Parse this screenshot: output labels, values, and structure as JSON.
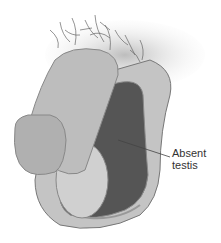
{
  "figure": {
    "callouts": [
      {
        "line1": "Absent",
        "line2": "testis"
      }
    ]
  },
  "colors": {
    "skin_light": "#c9c9c9",
    "skin_mid": "#b3b3b3",
    "cavity_dark": "#555555",
    "outline": "#777777",
    "hair": "#666666",
    "label": "#333333"
  }
}
